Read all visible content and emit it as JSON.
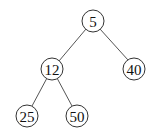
{
  "diagram": {
    "type": "binary-tree",
    "nodes": [
      {
        "id": "n5",
        "label": "5",
        "x": 93,
        "y": 21
      },
      {
        "id": "n12",
        "label": "12",
        "x": 52,
        "y": 69
      },
      {
        "id": "n40",
        "label": "40",
        "x": 134,
        "y": 69
      },
      {
        "id": "n25",
        "label": "25",
        "x": 27,
        "y": 116
      },
      {
        "id": "n50",
        "label": "50",
        "x": 77,
        "y": 116
      }
    ],
    "edges": [
      {
        "from": "n5",
        "to": "n12"
      },
      {
        "from": "n5",
        "to": "n40"
      },
      {
        "from": "n12",
        "to": "n25"
      },
      {
        "from": "n12",
        "to": "n50"
      }
    ]
  }
}
